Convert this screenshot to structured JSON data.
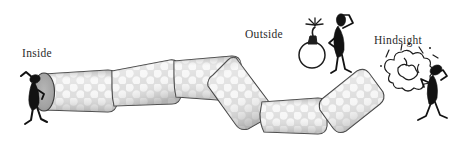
{
  "figure": {
    "background_color": "#ffffff",
    "width": 460,
    "height": 147,
    "stroke_color": "#3a3a3a",
    "silhouette_color": "#121212",
    "tunnel_fill_color": "#d9d9d9",
    "tunnel_highlight_color": "#f2f2f2",
    "entrance_fill_color": "#a8a8a8"
  },
  "labels": {
    "inside": "Inside",
    "outside": "Outside",
    "hindsight": "Hindsight"
  },
  "icons": {
    "inside_figure": "person-peering-into-tunnel-icon",
    "tunnel": "segmented-zigzag-tunnel-icon",
    "tunnel_entrance": "tunnel-entrance-opening-icon",
    "bomb": "lit-bomb-icon",
    "bomb_spark": "spark-burst-icon",
    "outside_figure": "person-hand-to-head-icon",
    "explosion": "explosion-puff-cloud-icon",
    "debris": "flying-debris-marks-icon",
    "hindsight_figure": "person-recoiling-looking-back-icon"
  },
  "label_positions": {
    "inside": {
      "x": 22,
      "y": 57
    },
    "outside": {
      "x": 245,
      "y": 38
    },
    "hindsight": {
      "x": 374,
      "y": 44
    }
  },
  "tunnel_segments": [
    {
      "name": "segment-1-entrance",
      "order": 1
    },
    {
      "name": "segment-2-rise",
      "order": 2
    },
    {
      "name": "segment-3-crest",
      "order": 3
    },
    {
      "name": "segment-4-descent",
      "order": 4
    },
    {
      "name": "segment-5-trough",
      "order": 5
    },
    {
      "name": "segment-6-exit-rise",
      "order": 6
    }
  ]
}
